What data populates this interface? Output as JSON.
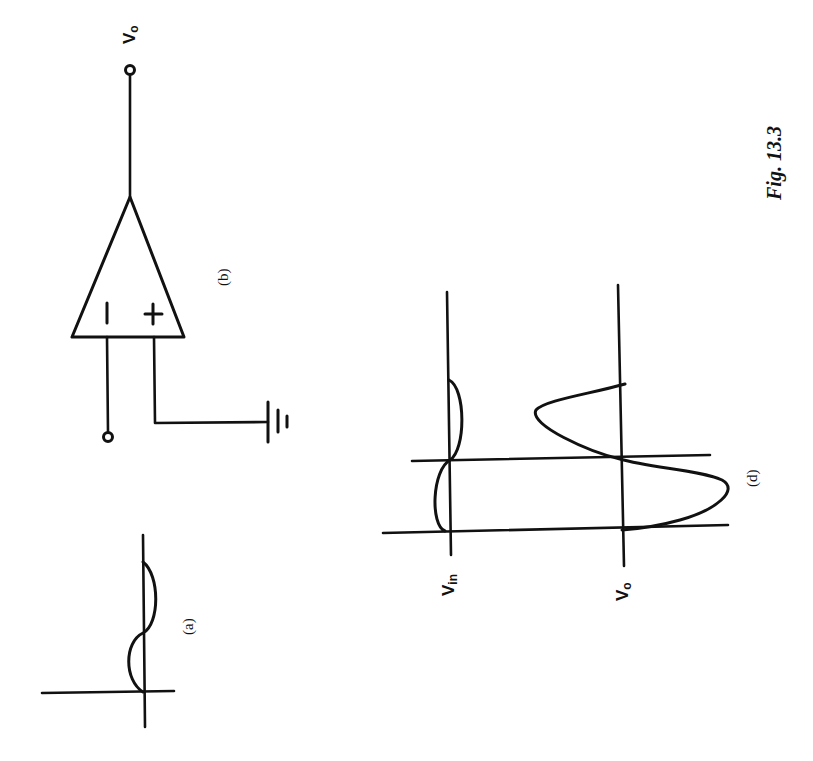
{
  "figure": {
    "caption": "Fig. 13.3",
    "orientation": "rotated 90° (landscape page)",
    "colors": {
      "ink": "#111111",
      "background": "#ffffff"
    }
  },
  "panels": {
    "a": {
      "label": "(a)",
      "description": "Input waveform: one full sine cycle starting at origin"
    },
    "b": {
      "label": "(b)",
      "description": "Op-amp comparator, non-inverting input grounded",
      "inverting_symbol": "−",
      "noninverting_symbol": "+",
      "output_label": "V",
      "output_sub": "o",
      "ground": "ground-symbol"
    },
    "d": {
      "label": "(d)",
      "description": "Input Vin and output Vo waveforms with zero-crossing markers",
      "vin_label": "V",
      "vin_sub": "in",
      "vo_label": "V",
      "vo_sub": "o"
    }
  }
}
